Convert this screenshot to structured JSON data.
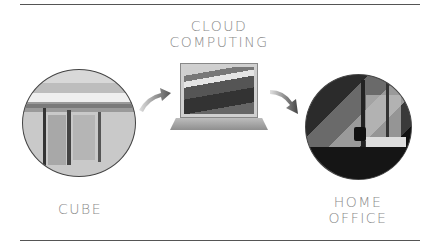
{
  "title": {
    "line1": "CLOUD",
    "line2": "COMPUTING"
  },
  "nodes": [
    {
      "id": "cube",
      "label_lines": [
        "CUBE"
      ],
      "image": "office-cubicles-photo"
    },
    {
      "id": "cloud",
      "label_lines": [
        "CLOUD",
        "COMPUTING"
      ],
      "image": "laptop-photo"
    },
    {
      "id": "home",
      "label_lines": [
        "HOME",
        "OFFICE"
      ],
      "image": "home-office-photo"
    }
  ],
  "labels": {
    "cube": "CUBE",
    "home_line1": "HOME",
    "home_line2": "OFFICE"
  },
  "arrows": [
    {
      "from": "cube",
      "to": "cloud",
      "icon": "curved-arrow-up-right-icon"
    },
    {
      "from": "cloud",
      "to": "home",
      "icon": "curved-arrow-down-right-icon"
    }
  ],
  "colors": {
    "text": "#8a8a8a",
    "rule": "#555555",
    "arrow": "#6b6b6b"
  }
}
